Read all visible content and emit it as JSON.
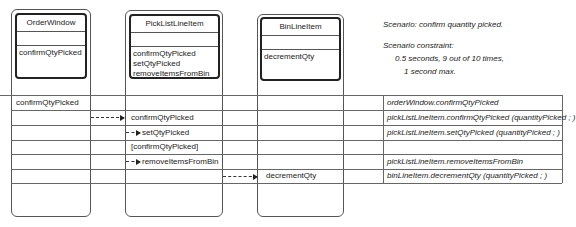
{
  "classes": [
    {
      "name": "OrderWindow",
      "operations": [
        "confirmQtyPicked"
      ]
    },
    {
      "name": "PickListLineItem",
      "operations": [
        "confirmQtyPicked",
        "setQtyPicked",
        "removeItemsFromBin"
      ]
    },
    {
      "name": "BinLineItem",
      "operations": [
        "decrementQty"
      ]
    }
  ],
  "scenario": {
    "title": "Scenario:  confirm quantity picked.",
    "constraint_label": "Scenario constraint:",
    "constraint_line1": "0.5 seconds, 9 out of 10 times,",
    "constraint_line2": "1 second max."
  },
  "rows": [
    {
      "col1": "confirmQtyPicked",
      "col2": "",
      "col3": "",
      "description": "orderWindow.confirmQtyPicked"
    },
    {
      "col1": "",
      "col2": "confirmQtyPicked",
      "col3": "",
      "description": "pickListLineItem.confirmQtyPicked (quantityPicked ; )"
    },
    {
      "col1": "",
      "col2": "setQtyPicked",
      "col3": "",
      "description": "pickListLineItem.setQtyPicked (quantityPicked ; )"
    },
    {
      "col1": "",
      "col2": "[confirmQtyPicked]",
      "col3": "",
      "description": ""
    },
    {
      "col1": "",
      "col2": "removeItemsFromBin",
      "col3": "",
      "description": "pickListLineItem.removeItemsFromBin"
    },
    {
      "col1": "",
      "col2": "",
      "col3": "decrementQty",
      "description": "binLineItem.decrementQty (quantityPicked ; )"
    }
  ]
}
